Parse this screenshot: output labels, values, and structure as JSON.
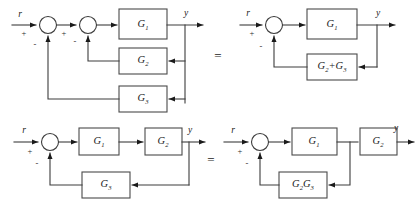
{
  "figure": {
    "stroke_color": "#3c3c3c",
    "block_stroke_color": "#4a4a4a",
    "background": "#ffffff",
    "equals_sign": "="
  },
  "diagrams": [
    {
      "id": "top-left",
      "caption": "Nested feedback with two parallel feedback paths",
      "input_label": "r",
      "output_label": "y",
      "summers": [
        {
          "name": "outer-summer",
          "input_sign": "+",
          "feedback_sign": "-"
        },
        {
          "name": "inner-summer",
          "input_sign": "+",
          "feedback_sign": "-"
        }
      ],
      "blocks": [
        {
          "name": "forward-block",
          "label": "G",
          "subscript": "1"
        },
        {
          "name": "inner-feedback-block",
          "label": "G",
          "subscript": "2"
        },
        {
          "name": "outer-feedback-block",
          "label": "G",
          "subscript": "3"
        }
      ]
    },
    {
      "id": "top-right",
      "caption": "Combined single feedback path",
      "input_label": "r",
      "output_label": "y",
      "summers": [
        {
          "name": "summer",
          "input_sign": "+",
          "feedback_sign": "-"
        }
      ],
      "blocks": [
        {
          "name": "forward-block",
          "label": "G",
          "subscript": "1"
        },
        {
          "name": "feedback-block",
          "label": "G2 + G3",
          "parts": [
            {
              "label": "G",
              "subscript": "2"
            },
            {
              "operator": "+"
            },
            {
              "label": "G",
              "subscript": "3"
            }
          ]
        }
      ]
    },
    {
      "id": "bottom-left",
      "caption": "Feedback taken from output after G2",
      "input_label": "r",
      "output_label": "y",
      "summers": [
        {
          "name": "summer",
          "input_sign": "+",
          "feedback_sign": "-"
        }
      ],
      "blocks": [
        {
          "name": "forward-block-1",
          "label": "G",
          "subscript": "1"
        },
        {
          "name": "forward-block-2",
          "label": "G",
          "subscript": "2"
        },
        {
          "name": "feedback-block",
          "label": "G",
          "subscript": "3"
        }
      ]
    },
    {
      "id": "bottom-right",
      "caption": "Feedback tap moved ahead of G2",
      "input_label": "r",
      "output_label": "y",
      "summers": [
        {
          "name": "summer",
          "input_sign": "+",
          "feedback_sign": "-"
        }
      ],
      "blocks": [
        {
          "name": "forward-block-1",
          "label": "G",
          "subscript": "1"
        },
        {
          "name": "forward-block-2",
          "label": "G",
          "subscript": "2"
        },
        {
          "name": "feedback-block",
          "label": "G2G3",
          "parts": [
            {
              "label": "G",
              "subscript": "2"
            },
            {
              "label": "G",
              "subscript": "3"
            }
          ]
        }
      ]
    }
  ]
}
